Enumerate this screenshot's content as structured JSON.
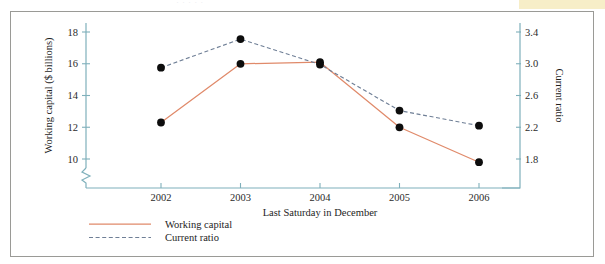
{
  "page": {
    "ghost_header_text": "·   ·   ·   ·    ·",
    "frame_border_color": "#9a9a96",
    "highlight_color": "#f7eec8",
    "background_color": "#ffffff"
  },
  "chart_data": {
    "type": "line",
    "title": "",
    "subtitle": "",
    "xlabel": "Last Saturday in December",
    "categories": [
      "2002",
      "2003",
      "2004",
      "2005",
      "2006"
    ],
    "x": [
      2002,
      2003,
      2004,
      2005,
      2006
    ],
    "grid": false,
    "legend_position": "below-left",
    "axes": {
      "left": {
        "label": "Working capital ($ billions)",
        "ticks": [
          10,
          12,
          14,
          16,
          18
        ],
        "tick_labels": [
          "10",
          "12",
          "14",
          "16",
          "18"
        ],
        "lim": [
          10,
          18
        ],
        "broken_axis": true,
        "color": "#7fb0bb"
      },
      "right": {
        "label": "Current ratio",
        "ticks": [
          1.8,
          2.2,
          2.6,
          3.0,
          3.4
        ],
        "tick_labels": [
          "1.8",
          "2.2",
          "2.6",
          "3.0",
          "3.4"
        ],
        "lim": [
          1.8,
          3.4
        ],
        "color": "#7fb0bb"
      }
    },
    "series": [
      {
        "name": "Working capital",
        "axis": "left",
        "style": "solid",
        "color": "#e08a6a",
        "marker": "filled-circle",
        "marker_color": "#0d0d0d",
        "values": [
          12.3,
          16.0,
          16.1,
          12.0,
          9.8
        ]
      },
      {
        "name": "Current ratio",
        "axis": "right",
        "style": "dashed",
        "color": "#6f7f96",
        "marker": "filled-circle",
        "marker_color": "#0d0d0d",
        "values": [
          2.95,
          3.31,
          2.99,
          2.41,
          2.22
        ]
      }
    ]
  },
  "legend": {
    "entries": [
      {
        "label": "Working capital",
        "style": "solid",
        "color": "#e08a6a"
      },
      {
        "label": "Current ratio",
        "style": "dashed",
        "color": "#6f7f96"
      }
    ]
  }
}
